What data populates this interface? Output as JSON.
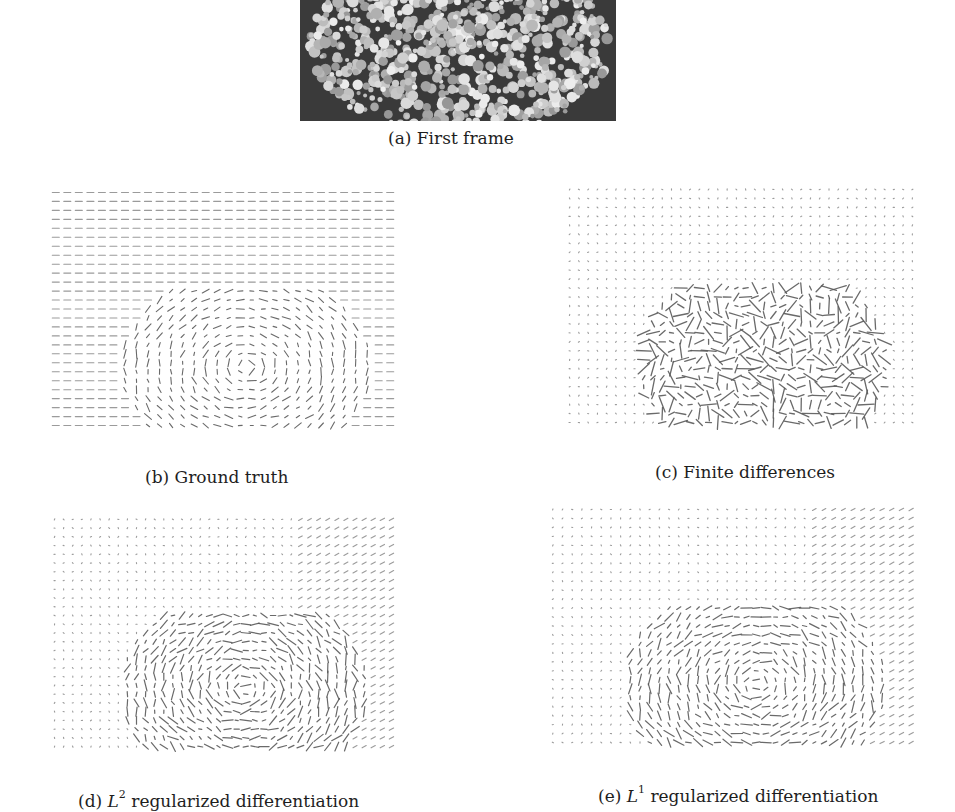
{
  "figure": {
    "panels": [
      {
        "id": "a",
        "kind": "photo",
        "caption": "(a) First frame",
        "description": "Photograph of a white hydrangea flower cluster on a dark grey background (cropped at top)"
      },
      {
        "id": "b",
        "kind": "vector-field",
        "caption_prefix": "(b)",
        "caption_text": "Ground truth",
        "grid": {
          "cols": 30,
          "rows": 27
        },
        "style": "dashes",
        "background_flow": "uniform horizontal",
        "object_flow": "varied short vectors inside object region"
      },
      {
        "id": "c",
        "kind": "vector-field",
        "caption_prefix": "(c)",
        "caption_text": "Finite differences",
        "grid": {
          "cols": 38,
          "rows": 27
        },
        "style": "dots",
        "background_flow": "near-zero dots",
        "object_flow": "noisy large vectors inside object region"
      },
      {
        "id": "d",
        "kind": "vector-field",
        "caption_prefix": "(d)",
        "caption_var": "L",
        "caption_sup": "2",
        "caption_text": "regularized differentiation",
        "grid": {
          "cols": 38,
          "rows": 27
        },
        "style": "dots",
        "background_flow": "near-zero dots, slight diagonal on right",
        "object_flow": "smoothed swirling vectors inside object region"
      },
      {
        "id": "e",
        "kind": "vector-field",
        "caption_prefix": "(e)",
        "caption_var": "L",
        "caption_sup": "1",
        "caption_text": "regularized differentiation",
        "grid": {
          "cols": 38,
          "rows": 27
        },
        "style": "dots",
        "background_flow": "near-zero dots, slight diagonal on right",
        "object_flow": "piecewise smooth vectors inside object region"
      }
    ]
  },
  "colors": {
    "ink": "#5a5a5a",
    "photo_bg": "#3a3a3a",
    "flower": "#cfcfcf"
  }
}
